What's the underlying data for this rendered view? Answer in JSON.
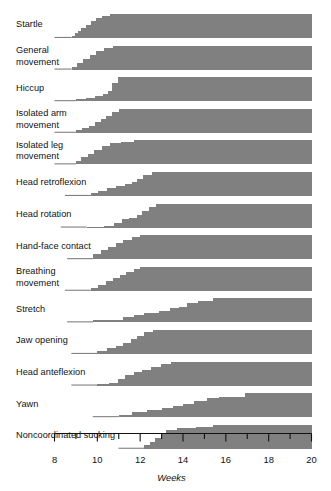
{
  "chart_data": {
    "type": "area",
    "title": "",
    "xlabel": "Weeks",
    "ylabel": "",
    "xlim": [
      8,
      20
    ],
    "grid": false,
    "legend": null,
    "xticks": [
      8,
      9,
      10,
      11,
      12,
      13,
      14,
      15,
      16,
      17,
      18,
      19,
      20
    ],
    "xtick_labels": [
      "8",
      "",
      "10",
      "",
      "12",
      "",
      "14",
      "",
      "16",
      "",
      "18",
      "",
      "20"
    ],
    "band_color": "#808080",
    "categories": [
      "Startle",
      "General movement",
      "Hiccup",
      "Isolated arm movement",
      "Isolated leg movement",
      "Head retroflexion",
      "Head rotation",
      "Hand-face contact",
      "Breathing movement",
      "Stretch",
      "Jaw opening",
      "Head anteflexion",
      "Yawn",
      "Noncoordinated sucking"
    ],
    "series": [
      {
        "name": "Startle",
        "onset_week": 8.8,
        "steps": [
          [
            8.8,
            0.1
          ],
          [
            8.95,
            0.22
          ],
          [
            9.1,
            0.3
          ],
          [
            9.25,
            0.42
          ],
          [
            9.45,
            0.55
          ],
          [
            9.7,
            0.7
          ],
          [
            9.95,
            0.84
          ],
          [
            10.2,
            0.93
          ],
          [
            10.6,
            1.0
          ],
          [
            20.0,
            1.0
          ]
        ]
      },
      {
        "name": "General movement",
        "onset_week": 8.8,
        "steps": [
          [
            8.8,
            0.12
          ],
          [
            9.05,
            0.28
          ],
          [
            9.35,
            0.45
          ],
          [
            9.65,
            0.62
          ],
          [
            9.95,
            0.78
          ],
          [
            10.3,
            0.9
          ],
          [
            10.75,
            1.0
          ],
          [
            20.0,
            1.0
          ]
        ]
      },
      {
        "name": "Hiccup",
        "onset_week": 9.0,
        "steps": [
          [
            9.0,
            0.1
          ],
          [
            9.45,
            0.14
          ],
          [
            9.9,
            0.2
          ],
          [
            10.25,
            0.28
          ],
          [
            10.5,
            0.42
          ],
          [
            10.7,
            0.75
          ],
          [
            10.95,
            1.0
          ],
          [
            20.0,
            1.0
          ]
        ]
      },
      {
        "name": "Isolated arm movement",
        "onset_week": 9.0,
        "steps": [
          [
            9.0,
            0.1
          ],
          [
            9.3,
            0.18
          ],
          [
            9.6,
            0.3
          ],
          [
            9.9,
            0.44
          ],
          [
            10.15,
            0.58
          ],
          [
            10.4,
            0.72
          ],
          [
            10.7,
            0.86
          ],
          [
            11.0,
            1.0
          ],
          [
            20.0,
            1.0
          ]
        ]
      },
      {
        "name": "Isolated leg movement",
        "onset_week": 9.0,
        "steps": [
          [
            9.0,
            0.14
          ],
          [
            9.25,
            0.3
          ],
          [
            9.55,
            0.45
          ],
          [
            9.85,
            0.62
          ],
          [
            10.2,
            0.78
          ],
          [
            10.6,
            0.88
          ],
          [
            11.1,
            0.95
          ],
          [
            11.7,
            1.0
          ],
          [
            20.0,
            1.0
          ]
        ]
      },
      {
        "name": "Head retroflexion",
        "onset_week": 9.7,
        "steps": [
          [
            9.7,
            0.12
          ],
          [
            10.05,
            0.22
          ],
          [
            10.45,
            0.32
          ],
          [
            10.85,
            0.4
          ],
          [
            11.3,
            0.5
          ],
          [
            11.6,
            0.58
          ],
          [
            11.85,
            0.72
          ],
          [
            12.15,
            0.86
          ],
          [
            12.55,
            1.0
          ],
          [
            20.0,
            1.0
          ]
        ]
      },
      {
        "name": "Head rotation",
        "onset_week": 9.5,
        "steps": [
          [
            9.5,
            0.04
          ],
          [
            10.3,
            0.08
          ],
          [
            10.8,
            0.18
          ],
          [
            11.15,
            0.34
          ],
          [
            11.5,
            0.42
          ],
          [
            11.85,
            0.52
          ],
          [
            12.1,
            0.68
          ],
          [
            12.4,
            0.86
          ],
          [
            12.75,
            1.0
          ],
          [
            20.0,
            1.0
          ]
        ]
      },
      {
        "name": "Hand-face contact",
        "onset_week": 9.8,
        "steps": [
          [
            9.8,
            0.2
          ],
          [
            10.15,
            0.38
          ],
          [
            10.5,
            0.52
          ],
          [
            10.85,
            0.66
          ],
          [
            11.2,
            0.8
          ],
          [
            11.6,
            0.92
          ],
          [
            12.0,
            1.0
          ],
          [
            20.0,
            1.0
          ]
        ]
      },
      {
        "name": "Breathing movement",
        "onset_week": 9.7,
        "steps": [
          [
            9.7,
            0.12
          ],
          [
            10.05,
            0.26
          ],
          [
            10.4,
            0.4
          ],
          [
            10.75,
            0.52
          ],
          [
            11.05,
            0.64
          ],
          [
            11.35,
            0.78
          ],
          [
            11.7,
            0.92
          ],
          [
            12.0,
            1.0
          ],
          [
            20.0,
            1.0
          ]
        ]
      },
      {
        "name": "Stretch",
        "onset_week": 9.8,
        "steps": [
          [
            9.8,
            0.08
          ],
          [
            10.8,
            0.12
          ],
          [
            11.2,
            0.22
          ],
          [
            11.7,
            0.3
          ],
          [
            12.2,
            0.38
          ],
          [
            12.9,
            0.46
          ],
          [
            13.4,
            0.58
          ],
          [
            13.8,
            0.66
          ],
          [
            14.2,
            0.8
          ],
          [
            14.7,
            0.9
          ],
          [
            15.4,
            1.0
          ],
          [
            20.0,
            1.0
          ]
        ]
      },
      {
        "name": "Jaw opening",
        "onset_week": 10.0,
        "steps": [
          [
            10.0,
            0.12
          ],
          [
            10.45,
            0.24
          ],
          [
            10.85,
            0.34
          ],
          [
            11.2,
            0.44
          ],
          [
            11.55,
            0.62
          ],
          [
            11.85,
            0.76
          ],
          [
            12.2,
            0.9
          ],
          [
            12.6,
            1.0
          ],
          [
            20.0,
            1.0
          ]
        ]
      },
      {
        "name": "Head anteflexion",
        "onset_week": 10.0,
        "steps": [
          [
            10.0,
            0.06
          ],
          [
            10.55,
            0.12
          ],
          [
            10.95,
            0.28
          ],
          [
            11.3,
            0.44
          ],
          [
            11.7,
            0.56
          ],
          [
            12.1,
            0.66
          ],
          [
            12.5,
            0.78
          ],
          [
            12.95,
            0.92
          ],
          [
            13.45,
            1.0
          ],
          [
            20.0,
            1.0
          ]
        ]
      },
      {
        "name": "Yawn",
        "onset_week": 11.0,
        "steps": [
          [
            11.0,
            0.1
          ],
          [
            11.6,
            0.2
          ],
          [
            12.3,
            0.28
          ],
          [
            13.0,
            0.38
          ],
          [
            13.55,
            0.48
          ],
          [
            14.0,
            0.56
          ],
          [
            14.5,
            0.68
          ],
          [
            15.1,
            0.78
          ],
          [
            15.7,
            0.86
          ],
          [
            16.9,
            1.0
          ],
          [
            20.0,
            1.0
          ]
        ]
      },
      {
        "name": "Noncoordinated sucking",
        "onset_week": 12.2,
        "steps": [
          [
            12.2,
            0.14
          ],
          [
            12.45,
            0.3
          ],
          [
            12.7,
            0.44
          ],
          [
            12.95,
            0.62
          ],
          [
            13.2,
            0.78
          ],
          [
            13.7,
            0.86
          ],
          [
            14.6,
            0.9
          ],
          [
            15.4,
            1.0
          ],
          [
            20.0,
            1.0
          ]
        ]
      }
    ]
  }
}
